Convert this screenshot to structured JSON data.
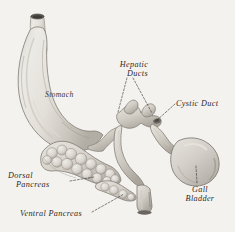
{
  "figure": {
    "background_color": "#f4f2ee",
    "ink_color": "#2b2a28",
    "medium": "engraving-wash"
  },
  "labels": {
    "hepatic_ducts": {
      "line1": "Hepatic",
      "line2": "Ducts"
    },
    "cystic_duct": {
      "line1": "Cystic Duct"
    },
    "stomach": {
      "line1": "Stomach"
    },
    "gall_bladder": {
      "line1": "Gall",
      "line2": "Bladder"
    },
    "dorsal_pancreas": {
      "line1": "Dorsal",
      "line2": "Pancreas"
    },
    "ventral_pancreas": {
      "line1": "Ventral Pancreas"
    }
  },
  "structures": [
    {
      "name": "stomach",
      "label": "Stomach"
    },
    {
      "name": "esophagus",
      "label": ""
    },
    {
      "name": "hepatic-ducts",
      "label": "Hepatic Ducts"
    },
    {
      "name": "cystic-duct",
      "label": "Cystic Duct"
    },
    {
      "name": "gall-bladder",
      "label": "Gall Bladder"
    },
    {
      "name": "dorsal-pancreas",
      "label": "Dorsal Pancreas"
    },
    {
      "name": "ventral-pancreas",
      "label": "Ventral Pancreas"
    },
    {
      "name": "duodenum",
      "label": ""
    }
  ],
  "leaders": [
    {
      "name": "hepatic-ducts-left",
      "style": "dashed"
    },
    {
      "name": "hepatic-ducts-right",
      "style": "dashed"
    },
    {
      "name": "cystic-duct",
      "style": "dashed"
    },
    {
      "name": "gall-bladder",
      "style": "dashed"
    },
    {
      "name": "dorsal-pancreas",
      "style": "dashed"
    },
    {
      "name": "ventral-pancreas",
      "style": "dashed"
    }
  ]
}
